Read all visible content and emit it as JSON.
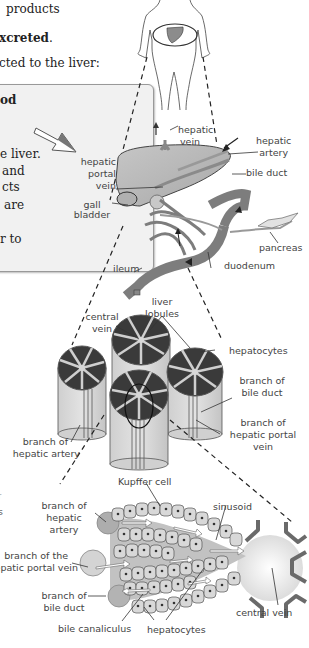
{
  "text_fragments": {
    "line1": "products",
    "line2": "xcreted",
    "line2_punct": ".",
    "line3": "cted to the liver:"
  },
  "info_box": {
    "line1": "od",
    "line2": "e liver.",
    "line3": "and",
    "line4": "cts",
    "line5": "are",
    "line6": "r to"
  },
  "body_figure": {
    "highlight": "liver",
    "liver_color": "#8c8c8c"
  },
  "liver_diagram": {
    "labels": {
      "hepatic_vein": [
        "hepatic",
        "vein"
      ],
      "hepatic_artery": [
        "hepatic",
        "artery"
      ],
      "bile_duct": "bile duct",
      "hepatic_portal_vein": [
        "hepatic",
        "portal",
        "vein"
      ],
      "gall_bladder": [
        "gall",
        "bladder"
      ],
      "pancreas": "pancreas",
      "ileum": "ileum",
      "duodenum": "duodenum"
    }
  },
  "lobule_diagram": {
    "labels": {
      "central_vein": [
        "central",
        "vein"
      ],
      "liver_lobules": [
        "liver",
        "lobules"
      ],
      "hepatocytes": "hepatocytes",
      "branch_of_bile_duct": [
        "branch of",
        "bile duct"
      ],
      "branch_of_hepatic_portal_vein": [
        "branch of",
        "hepatic portal",
        "vein"
      ],
      "branch_of_hepatic_artery": [
        "branch of",
        "hepatic artery"
      ]
    }
  },
  "sinusoid_diagram": {
    "labels": {
      "kupffer_cell": "Kupffer cell",
      "sinusoid": "sinusoid",
      "branch_of_hepatic_artery": [
        "branch of",
        "hepatic",
        "artery"
      ],
      "branch_of_hepatic_portal_vein": [
        "branch of the",
        "hepatic portal vein"
      ],
      "branch_of_bile_duct": [
        "branch of",
        "bile duct"
      ],
      "bile_canaliculus": "bile canaliculus",
      "hepatocytes": "hepatocytes",
      "central_vein": "central vein"
    }
  },
  "side_fragments": {
    "s1": "r",
    "s2": "s"
  },
  "colors": {
    "organ_gray": "#9a9a9a",
    "vessel_gray": "#7d7d7d",
    "light_gray": "#d4d4d4",
    "dark_stripe": "#3a3a3a",
    "box_bg": "#f1f1f1",
    "arrow_gray": "#666666"
  }
}
